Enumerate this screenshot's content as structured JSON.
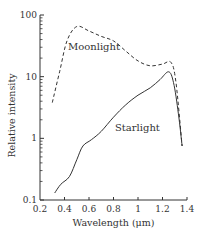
{
  "chart_data": {
    "type": "line",
    "title": "",
    "xlabel": "Wavelength (μm)",
    "ylabel": "Relative intensity",
    "xlim": [
      0.2,
      1.4
    ],
    "ylim": [
      0.1,
      100
    ],
    "yscale": "log",
    "grid": false,
    "legend": "inline labels",
    "x_ticks": [
      "0.2",
      "0.4",
      "0.6",
      "0.8",
      "1",
      "1.2",
      "1.4"
    ],
    "y_ticks": [
      "0.1",
      "1",
      "10",
      "100"
    ],
    "series": [
      {
        "name": "Moonlight",
        "style": "dashed",
        "x": [
          0.3,
          0.36,
          0.42,
          0.5,
          0.6,
          0.7,
          0.8,
          0.9,
          1.0,
          1.1,
          1.2,
          1.27,
          1.31,
          1.36
        ],
        "values": [
          3.8,
          12,
          38,
          65,
          55,
          45,
          38,
          26,
          18,
          15,
          16,
          17,
          8,
          0.75
        ]
      },
      {
        "name": "Starlight",
        "style": "solid",
        "x": [
          0.32,
          0.37,
          0.44,
          0.5,
          0.55,
          0.62,
          0.7,
          0.8,
          0.9,
          1.0,
          1.1,
          1.18,
          1.25,
          1.29,
          1.33,
          1.36
        ],
        "values": [
          0.13,
          0.18,
          0.24,
          0.45,
          0.75,
          0.95,
          1.3,
          2.2,
          3.5,
          5.0,
          6.6,
          9,
          12,
          8,
          2.5,
          0.75
        ]
      }
    ]
  }
}
